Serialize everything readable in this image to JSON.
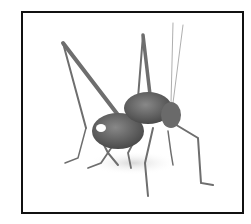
{
  "image": {
    "subject": "grasshopper",
    "alt": "Grayscale photo of a long-legged cricket / katydid standing on a white background",
    "colors": {
      "background": "#ffffff",
      "frame_border": "#111111",
      "body": "#5a5a5a",
      "legs": "#777777",
      "shadow": "#e4e4e4"
    }
  }
}
